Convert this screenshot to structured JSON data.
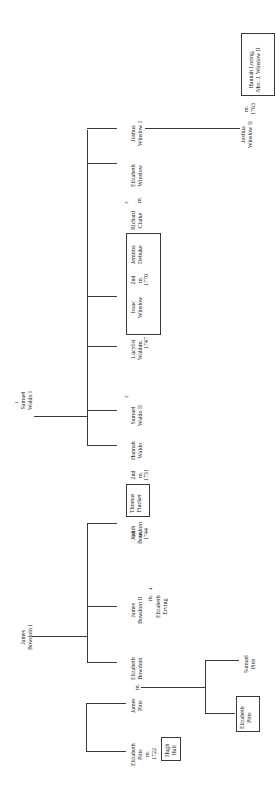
{
  "diagram": {
    "type": "genealogy-tree",
    "orientation": "rotated-90-ccw",
    "roots": [
      {
        "id": "samuel-waldo-i",
        "name": [
          "Samuel",
          "Waldo I"
        ],
        "note": "1"
      },
      {
        "id": "james-bowdoin-i",
        "name": [
          "James",
          "Bowdoin I"
        ]
      }
    ],
    "persons": {
      "samuel_waldo_i": {
        "line1": "Samuel",
        "line2": "Waldo I",
        "note": "1"
      },
      "james_bowdoin_i": {
        "line1": "James",
        "line2": "Bowdoin I"
      },
      "joshua_winslow_i": {
        "line1": "Joshua",
        "line2": "Winslow I"
      },
      "elizabeth_winslow": {
        "line1": "Elizabeth",
        "line2": "Winslow"
      },
      "richard_clarke": {
        "line1": "Richard",
        "line2": "Clarke",
        "note": "3"
      },
      "m_clarke": "m.",
      "isaac_winslow": {
        "line1": "Isaac",
        "line2": "Winslow"
      },
      "isaac_2nd_marriage": {
        "l1": "2nd",
        "l2": "m.",
        "l3": "1770"
      },
      "jemima_debuke": {
        "line1": "Jemima",
        "line2": "Debuke"
      },
      "isaac_1st_marriage": {
        "l1": "1st",
        "l2": "m.",
        "l3": "1747"
      },
      "lucy_waldo": {
        "line1": "Lucy",
        "line2": "Waldo"
      },
      "samuel_waldo_ii": {
        "line1": "Samuel",
        "line2": "Waldo II",
        "note": "2"
      },
      "hannah_waldo": {
        "line1": "Hannah",
        "line2": "Waldo"
      },
      "thomas_flucker_2nd": {
        "l1": "2nd",
        "l2": "m.",
        "l3": "1751"
      },
      "thomas_flucker": {
        "line1": "Thomas",
        "line2": "Flucker"
      },
      "judith_1st_marriage": {
        "l1": "1st",
        "l2": "m.",
        "l3": "1744"
      },
      "judith_bowdoin": {
        "line1": "Judith",
        "line2": "Bowdoin"
      },
      "james_bowdoin_ii": {
        "line1": "James",
        "line2": "Bowdoin II",
        "line3": "m.",
        "line4": "Elizabeth",
        "line5": "Erving",
        "note": "4"
      },
      "elizabeth_bowdoin": {
        "line1": "Elizabeth",
        "line2": "Bowdoin"
      },
      "m_pitts": "m.",
      "james_pitts": {
        "line1": "James",
        "line2": "Pitts"
      },
      "elizabeth_pitts_sr": {
        "line1": "Elizabeth",
        "line2": "Pitts",
        "line3": "m.",
        "line4": "1722"
      },
      "hugh_hall": {
        "line1": "Hugh",
        "line2": "Hall"
      },
      "samuel_pitts": {
        "line1": "Samuel",
        "line2": "Pitts"
      },
      "elizabeth_pitts_jr": {
        "line1": "Elizabeth",
        "line2": "Pitts"
      },
      "joshua_winslow_ii": {
        "line1": "Joshua",
        "line2": "Winslow II"
      },
      "m_winslow_ii": {
        "l1": "m.",
        "l2": "1763"
      },
      "hannah_loring": {
        "line1": "Hannah Loring,",
        "line2": "Mrs. J. Winslow II"
      }
    },
    "line_color": "#3a3a3a",
    "background": "#ffffff"
  }
}
